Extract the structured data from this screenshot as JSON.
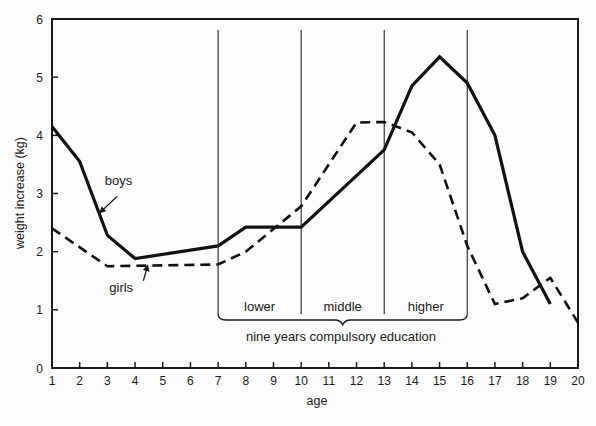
{
  "chart_data": {
    "type": "line",
    "title": "",
    "xlabel": "age",
    "ylabel": "weight increase (kg)",
    "xlim": [
      1,
      20
    ],
    "ylim": [
      0,
      6
    ],
    "x_ticks": [
      1,
      2,
      3,
      4,
      5,
      6,
      7,
      8,
      9,
      10,
      11,
      12,
      13,
      14,
      15,
      16,
      17,
      18,
      19,
      20
    ],
    "y_ticks": [
      0,
      1,
      2,
      3,
      4,
      5,
      6
    ],
    "grid": false,
    "legend": "inline labels with arrows",
    "series": [
      {
        "name": "boys",
        "style": "solid",
        "color": "#111111",
        "points": [
          [
            1,
            4.15
          ],
          [
            2,
            3.55
          ],
          [
            3,
            2.28
          ],
          [
            4,
            1.88
          ],
          [
            7,
            2.1
          ],
          [
            8,
            2.42
          ],
          [
            10,
            2.42
          ],
          [
            13,
            3.75
          ],
          [
            14,
            4.85
          ],
          [
            15,
            5.35
          ],
          [
            16,
            4.9
          ],
          [
            17,
            4.0
          ],
          [
            18,
            2.0
          ],
          [
            19,
            1.1
          ]
        ]
      },
      {
        "name": "girls",
        "style": "dashed",
        "color": "#111111",
        "points": [
          [
            1,
            2.4
          ],
          [
            3,
            1.75
          ],
          [
            7,
            1.78
          ],
          [
            8,
            2.0
          ],
          [
            10,
            2.78
          ],
          [
            12,
            4.22
          ],
          [
            13,
            4.23
          ],
          [
            14,
            4.05
          ],
          [
            15,
            3.5
          ],
          [
            16,
            2.1
          ],
          [
            17,
            1.1
          ],
          [
            18,
            1.2
          ],
          [
            19,
            1.55
          ],
          [
            20,
            0.78
          ]
        ]
      }
    ],
    "annotations": {
      "series_labels": [
        {
          "text": "boys",
          "x": 3.4,
          "y": 3.15,
          "arrow_from": [
            3.35,
            2.95
          ],
          "arrow_to": [
            2.75,
            2.68
          ]
        },
        {
          "text": "girls",
          "x": 3.5,
          "y": 1.3,
          "arrow_from": [
            4.3,
            1.5
          ],
          "arrow_to": [
            4.45,
            1.75
          ]
        }
      ],
      "school_divisions": [
        7,
        10,
        13,
        16
      ],
      "school_stages": [
        {
          "label": "lower",
          "from": 7,
          "to": 10
        },
        {
          "label": "middle",
          "from": 10,
          "to": 13
        },
        {
          "label": "higher",
          "from": 13,
          "to": 16
        }
      ],
      "brace_label": "nine years compulsory education"
    }
  }
}
